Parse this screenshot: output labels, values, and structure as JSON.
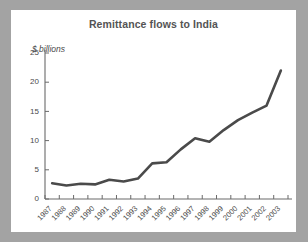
{
  "chart_data": {
    "type": "line",
    "title": "Remittance flows to India",
    "ylabel": "$ billions",
    "xlabel": "",
    "ylim": [
      0,
      25
    ],
    "yticks": [
      0,
      5,
      10,
      15,
      20,
      25
    ],
    "ytick_labels": [
      "0",
      "5",
      "10",
      "15",
      "20",
      "25"
    ],
    "grid": false,
    "legend": false,
    "line_color": "#4a4a4a",
    "background_color": "#ffffff",
    "page_background_color": "#a3a3a3",
    "axis_color": "#6a6a6a",
    "title_color": "#545454",
    "categories": [
      "1987",
      "1988",
      "1989",
      "1990",
      "1991",
      "1992",
      "1993",
      "1994",
      "1995",
      "1996",
      "1997",
      "1998",
      "1999",
      "2000",
      "2001",
      "2002",
      "2003"
    ],
    "x": [
      1987,
      1988,
      1989,
      1990,
      1991,
      1992,
      1993,
      1994,
      1995,
      1996,
      1997,
      1998,
      1999,
      2000,
      2001,
      2002,
      2003
    ],
    "values": [
      2.7,
      2.3,
      2.6,
      2.5,
      3.3,
      3.0,
      3.5,
      6.1,
      6.3,
      8.5,
      10.4,
      9.8,
      11.8,
      13.5,
      14.8,
      16.0,
      22.0
    ],
    "series": [
      {
        "name": "Remittance flows to India",
        "values": [
          2.7,
          2.3,
          2.6,
          2.5,
          3.3,
          3.0,
          3.5,
          6.1,
          6.3,
          8.5,
          10.4,
          9.8,
          11.8,
          13.5,
          14.8,
          16.0,
          22.0
        ]
      }
    ],
    "xtick_rotation": -45
  }
}
